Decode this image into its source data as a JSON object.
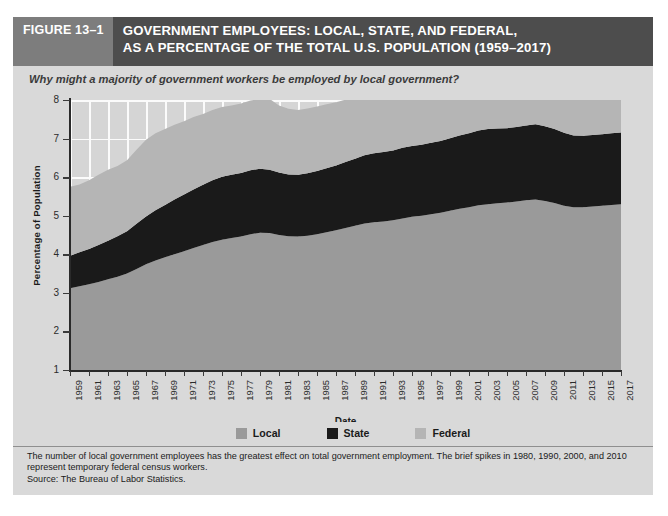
{
  "figure": {
    "number_label": "FIGURE 13–1",
    "title": "GOVERNMENT EMPLOYEES: LOCAL, STATE, AND FEDERAL,\nAS A PERCENTAGE OF THE TOTAL U.S. POPULATION (1959–2017)",
    "subtitle": "Why might a majority of government workers be employed by local government?",
    "footnote": "The number of local government employees has the greatest effect on total government employment. The brief spikes in 1980, 1990, 2000, and 2010 represent temporary federal census workers.",
    "source": "Source: The Bureau of Labor Statistics."
  },
  "colors": {
    "header_bar": "#4d4d4d",
    "figure_number_box": "#7d7d7d",
    "card_background": "#d9d9d9",
    "plot_background": "#d5d5d5",
    "gridline": "#fbfbfb",
    "local": "#9a9a9a",
    "state": "#1a1a1a",
    "federal": "#b5b5b5",
    "axis": "#2a2a2a"
  },
  "legend": {
    "position": "bottom-center",
    "items": [
      {
        "label": "Local",
        "color": "#9a9a9a"
      },
      {
        "label": "State",
        "color": "#1a1a1a"
      },
      {
        "label": "Federal",
        "color": "#b5b5b5"
      }
    ]
  },
  "chart_data": {
    "type": "area",
    "stacked": true,
    "title": "GOVERNMENT EMPLOYEES: LOCAL, STATE, AND FEDERAL, AS A PERCENTAGE OF THE TOTAL U.S. POPULATION (1959–2017)",
    "xlabel": "Date",
    "ylabel": "Percentage of Population",
    "ylim": [
      1,
      8
    ],
    "yticks": [
      1,
      2,
      3,
      4,
      5,
      6,
      7,
      8
    ],
    "xlim": [
      1959,
      2017
    ],
    "xticks": [
      1959,
      1961,
      1963,
      1965,
      1967,
      1969,
      1971,
      1973,
      1975,
      1977,
      1979,
      1981,
      1983,
      1985,
      1987,
      1989,
      1991,
      1993,
      1995,
      1997,
      1999,
      2001,
      2003,
      2005,
      2007,
      2009,
      2011,
      2013,
      2015,
      2017
    ],
    "grid": true,
    "note": "Series are stacked from the axis baseline at y = 1. Local is the bottom band, State the middle band, Federal the top band.",
    "x": [
      1959,
      1960,
      1961,
      1962,
      1963,
      1964,
      1965,
      1966,
      1967,
      1968,
      1969,
      1970,
      1971,
      1972,
      1973,
      1974,
      1975,
      1976,
      1977,
      1978,
      1979,
      1980,
      1981,
      1982,
      1983,
      1984,
      1985,
      1986,
      1987,
      1988,
      1989,
      1990,
      1991,
      1992,
      1993,
      1994,
      1995,
      1996,
      1997,
      1998,
      1999,
      2000,
      2001,
      2002,
      2003,
      2004,
      2005,
      2006,
      2007,
      2008,
      2009,
      2010,
      2011,
      2012,
      2013,
      2014,
      2015,
      2016,
      2017
    ],
    "series": [
      {
        "name": "Local",
        "values": [
          2.12,
          2.17,
          2.22,
          2.28,
          2.35,
          2.42,
          2.5,
          2.62,
          2.74,
          2.84,
          2.92,
          3.0,
          3.08,
          3.16,
          3.24,
          3.32,
          3.38,
          3.42,
          3.46,
          3.52,
          3.56,
          3.55,
          3.5,
          3.47,
          3.46,
          3.48,
          3.52,
          3.57,
          3.62,
          3.68,
          3.74,
          3.8,
          3.83,
          3.85,
          3.88,
          3.93,
          3.97,
          4.0,
          4.04,
          4.08,
          4.13,
          4.18,
          4.22,
          4.27,
          4.3,
          4.32,
          4.34,
          4.37,
          4.4,
          4.42,
          4.38,
          4.33,
          4.26,
          4.22,
          4.22,
          4.24,
          4.26,
          4.28,
          4.3
        ]
      },
      {
        "name": "State",
        "values": [
          0.84,
          0.88,
          0.92,
          0.96,
          1.0,
          1.05,
          1.1,
          1.17,
          1.24,
          1.3,
          1.36,
          1.42,
          1.47,
          1.52,
          1.56,
          1.6,
          1.63,
          1.64,
          1.65,
          1.66,
          1.66,
          1.64,
          1.62,
          1.6,
          1.6,
          1.62,
          1.64,
          1.66,
          1.68,
          1.71,
          1.74,
          1.77,
          1.79,
          1.8,
          1.81,
          1.83,
          1.84,
          1.84,
          1.85,
          1.86,
          1.88,
          1.9,
          1.92,
          1.94,
          1.95,
          1.94,
          1.93,
          1.93,
          1.94,
          1.95,
          1.94,
          1.92,
          1.89,
          1.86,
          1.85,
          1.85,
          1.85,
          1.86,
          1.86
        ]
      },
      {
        "name": "Federal",
        "values": [
          1.79,
          1.76,
          1.78,
          1.82,
          1.84,
          1.82,
          1.84,
          1.92,
          1.99,
          2.0,
          1.97,
          1.94,
          1.9,
          1.88,
          1.84,
          1.82,
          1.81,
          1.8,
          1.8,
          1.81,
          1.8,
          1.84,
          1.74,
          1.7,
          1.68,
          1.68,
          1.67,
          1.66,
          1.64,
          1.62,
          1.6,
          1.66,
          1.56,
          1.52,
          1.49,
          1.45,
          1.41,
          1.37,
          1.34,
          1.32,
          1.3,
          1.38,
          1.26,
          1.26,
          1.26,
          1.25,
          1.24,
          1.23,
          1.22,
          1.22,
          1.23,
          1.32,
          1.22,
          1.19,
          1.16,
          1.14,
          1.13,
          1.13,
          1.13
        ]
      }
    ]
  }
}
